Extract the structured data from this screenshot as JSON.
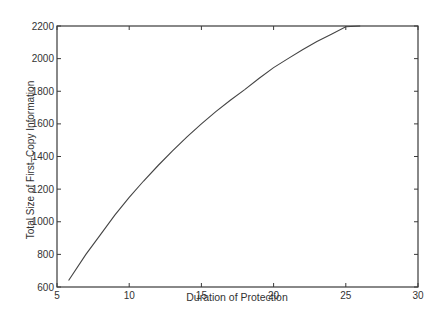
{
  "chart_data": {
    "type": "line",
    "title": "",
    "xlabel": "Duration of Protection",
    "ylabel": "Total Size of First–Copy Information",
    "xlim": [
      5,
      30
    ],
    "ylim": [
      600,
      2200
    ],
    "xticks": [
      5,
      10,
      15,
      20,
      25,
      30
    ],
    "yticks": [
      600,
      800,
      1000,
      1200,
      1400,
      1600,
      1800,
      2000,
      2200
    ],
    "grid": false,
    "legend": null,
    "series": [
      {
        "name": "Total Size of First-Copy Information",
        "x": [
          5.8,
          7,
          8,
          9,
          10,
          11,
          12,
          13,
          14,
          15,
          16,
          17,
          18,
          19,
          20,
          21,
          22,
          23,
          24,
          25,
          26
        ],
        "y": [
          640,
          800,
          920,
          1040,
          1150,
          1250,
          1345,
          1435,
          1520,
          1600,
          1675,
          1745,
          1810,
          1880,
          1945,
          2000,
          2055,
          2105,
          2150,
          2195,
          2235
        ]
      }
    ]
  }
}
